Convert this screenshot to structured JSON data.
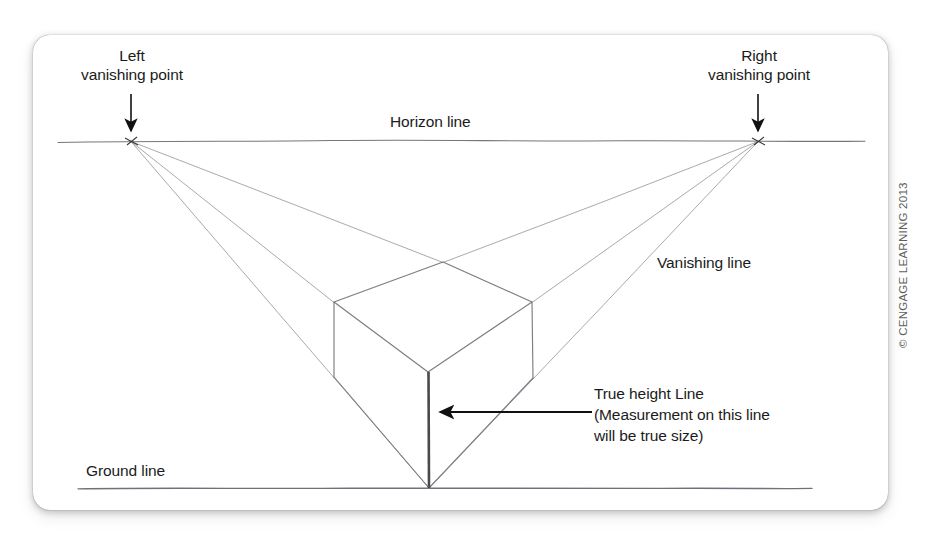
{
  "figure": {
    "kind": "two-point-perspective-construction-drawing",
    "labels": {
      "left_vanishing_point": "Left\nvanishing point",
      "right_vanishing_point": "Right\nvanishing point",
      "horizon_line": "Horizon line",
      "vanishing_line": "Vanishing line",
      "ground_line": "Ground line",
      "true_height_line": "True height Line\n(Measurement on this line\nwill be true size)"
    },
    "copyright": "© CENGAGE LEARNING 2013",
    "colors": {
      "page_background": "#ffffff",
      "card_background": "#ffffff",
      "pencil_line": "#8d8d93",
      "horizon_line": "#6f6f75",
      "ground_line": "#6f6f75",
      "cube_edge": "#76767c",
      "true_height_line": "#4a4a4a",
      "arrow": "#111111",
      "text": "#1b1b1b",
      "copyright_text": "#5e5e5e"
    },
    "geometry": {
      "left_vanishing_point": [
        131,
        141
      ],
      "right_vanishing_point": [
        758,
        141
      ],
      "horizon_line": [
        58,
        141,
        865,
        141
      ],
      "ground_line": [
        78,
        488,
        812,
        488
      ],
      "cube": {
        "front_top": [
          428,
          372
        ],
        "front_bottom": [
          429,
          488
        ],
        "left_top": [
          334,
          302
        ],
        "left_bottom": [
          334,
          377
        ],
        "right_top": [
          532,
          302
        ],
        "right_bottom": [
          533,
          378
        ],
        "back_top": [
          443,
          262
        ]
      },
      "vanishing_lines_left": [
        [
          131,
          141,
          443,
          262
        ],
        [
          131,
          141,
          334,
          302
        ],
        [
          131,
          141,
          429,
          488
        ]
      ],
      "vanishing_lines_right": [
        [
          758,
          141,
          443,
          262
        ],
        [
          758,
          141,
          532,
          302
        ],
        [
          758,
          141,
          429,
          488
        ]
      ],
      "pointer_arrow_true_height": [
        590,
        412,
        431,
        412
      ],
      "vp_arrow_left": [
        131,
        94,
        131,
        136
      ],
      "vp_arrow_right": [
        758,
        94,
        758,
        136
      ]
    }
  }
}
